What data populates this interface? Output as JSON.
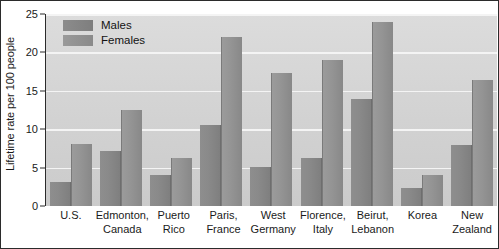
{
  "chart_data": {
    "type": "bar",
    "title": "",
    "subtitle": "",
    "xlabel": "",
    "ylabel": "Lifetime rate per 100 people",
    "ylim": [
      0,
      25
    ],
    "yticks": [
      0,
      5,
      10,
      15,
      20,
      25
    ],
    "ytick_labels": [
      "0",
      "5",
      "10",
      "15",
      "20",
      "25"
    ],
    "grid": true,
    "grid_axis": "y",
    "grid_color": "#f4f4f4",
    "legend_position": "upper-left-inside",
    "background_color": "#d4d4d4",
    "border_color": "#2b2b2b",
    "categories": [
      "U.S.",
      "Edmonton, Canada",
      "Puerto Rico",
      "Paris, France",
      "West Germany",
      "Florence, Italy",
      "Beirut, Lebanon",
      "Korea",
      "New Zealand"
    ],
    "category_lines": [
      [
        "U.S.",
        ""
      ],
      [
        "Edmonton,",
        "Canada"
      ],
      [
        "Puerto",
        "Rico"
      ],
      [
        "Paris,",
        "France"
      ],
      [
        "West",
        "Germany"
      ],
      [
        "Florence,",
        "Italy"
      ],
      [
        "Beirut,",
        "Lebanon"
      ],
      [
        "Korea",
        ""
      ],
      [
        "New",
        "Zealand"
      ]
    ],
    "series": [
      {
        "name": "Males",
        "color": "#868686",
        "values": [
          3.1,
          7.2,
          4.1,
          10.5,
          5.1,
          6.3,
          13.9,
          2.4,
          8.0
        ]
      },
      {
        "name": "Females",
        "color": "#949494",
        "values": [
          8.1,
          12.5,
          6.2,
          22.0,
          17.3,
          19.0,
          24.0,
          4.1,
          16.4
        ]
      }
    ]
  },
  "legend": {
    "items": [
      {
        "label": "Males",
        "swatch": "male"
      },
      {
        "label": "Females",
        "swatch": "female"
      }
    ]
  }
}
